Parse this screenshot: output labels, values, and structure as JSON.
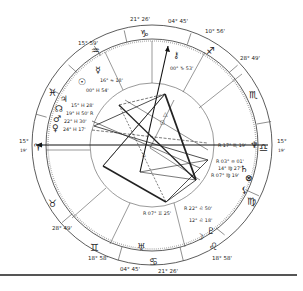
{
  "chart_title": "Natal Chart Wheel",
  "wheel": {
    "center": [
      152,
      145
    ],
    "outer_radius": 120,
    "zodiac_inner_radius": 106,
    "aspect_radius": 62
  },
  "angles": {
    "ascendant": {
      "sign": "Aries",
      "glyph": "♈",
      "deg": "15°",
      "min": "19'"
    },
    "descendant": {
      "sign": "Libra",
      "glyph": "♎",
      "deg": "15°",
      "min": "19'"
    },
    "mc": {
      "sign": "Capricorn",
      "glyph": "♑",
      "deg": "04°",
      "min": "45'"
    },
    "ic": {
      "sign": "Cancer",
      "glyph": "♋",
      "deg": "04°",
      "min": "45'"
    }
  },
  "house_cusps": [
    {
      "label": "21° 26'",
      "deg": "21°",
      "min": "26'",
      "pos": "top-left"
    },
    {
      "label": "04° 45'",
      "deg": "04°",
      "min": "45'",
      "pos": "top"
    },
    {
      "label": "10° 56'",
      "deg": "10°",
      "min": "56'",
      "pos": "top-right"
    },
    {
      "label": "28° 49'",
      "deg": "28°",
      "min": "49'",
      "pos": "right-upper"
    },
    {
      "label": "15° 19'",
      "deg": "15°",
      "min": "19'",
      "pos": "right"
    },
    {
      "label": "18° 58'",
      "deg": "18°",
      "min": "58'",
      "pos": "bottom-right"
    },
    {
      "label": "21° 26'",
      "deg": "21°",
      "min": "26'",
      "pos": "bottom"
    },
    {
      "label": "04° 45'",
      "deg": "04°",
      "min": "45'",
      "pos": "bottom-left"
    },
    {
      "label": "18° 58'",
      "deg": "18°",
      "min": "58'",
      "pos": "left-lower"
    },
    {
      "label": "28° 49'",
      "deg": "28°",
      "min": "49'",
      "pos": "left-lower2"
    },
    {
      "label": "15° 19'",
      "deg": "15°",
      "min": "19'",
      "pos": "left"
    },
    {
      "label": "15° 59'",
      "deg": "15°",
      "min": "59'",
      "pos": "top-left2"
    }
  ],
  "signs": [
    {
      "name": "Capricorn",
      "glyph": "♑"
    },
    {
      "name": "Sagittarius",
      "glyph": "♐"
    },
    {
      "name": "Scorpio",
      "glyph": "♏"
    },
    {
      "name": "Libra",
      "glyph": "♎"
    },
    {
      "name": "Virgo",
      "glyph": "♍"
    },
    {
      "name": "Leo",
      "glyph": "♌"
    },
    {
      "name": "Cancer",
      "glyph": "♋"
    },
    {
      "name": "Gemini",
      "glyph": "♊"
    },
    {
      "name": "Taurus",
      "glyph": "♉"
    },
    {
      "name": "Aries",
      "glyph": "♈"
    },
    {
      "name": "Pisces",
      "glyph": "♓"
    },
    {
      "name": "Aquarius",
      "glyph": "♒"
    }
  ],
  "planets": [
    {
      "name": "Mercury",
      "glyph": "☿",
      "text": "16° ≈ 18'"
    },
    {
      "name": "Sun",
      "glyph": "☉",
      "text": "00° H 54'"
    },
    {
      "name": "Jupiter",
      "glyph": "♃",
      "text": "15° H 28'"
    },
    {
      "name": "Node",
      "glyph": "☊",
      "text": "19° H 50' R"
    },
    {
      "name": "Mars",
      "glyph": "♂",
      "text": "22° H 30'"
    },
    {
      "name": "Venus",
      "glyph": "♀",
      "text": "24° H 17'"
    },
    {
      "name": "Chiron",
      "glyph": "⚷",
      "text": "00° ♑ 53'"
    },
    {
      "name": "Neptune",
      "glyph": "♆",
      "text": "R 17° ♏ 19'"
    },
    {
      "name": "Saturn",
      "glyph": "♄",
      "text": "R 03° ≏ 01'"
    },
    {
      "name": "Fortune",
      "glyph": "⊗",
      "text": "14° ♍ 27'"
    },
    {
      "name": "Lilith",
      "glyph": "⚸",
      "text": "R 07° ♍ 19'"
    },
    {
      "name": "Pluto",
      "glyph": "♇",
      "text": "R 22° ♌ 50'"
    },
    {
      "name": "Moon",
      "glyph": "☽",
      "text": "12° ♌ 18'"
    },
    {
      "name": "Uranus",
      "glyph": "♅",
      "text": "R 07° ♊ 25'"
    }
  ]
}
